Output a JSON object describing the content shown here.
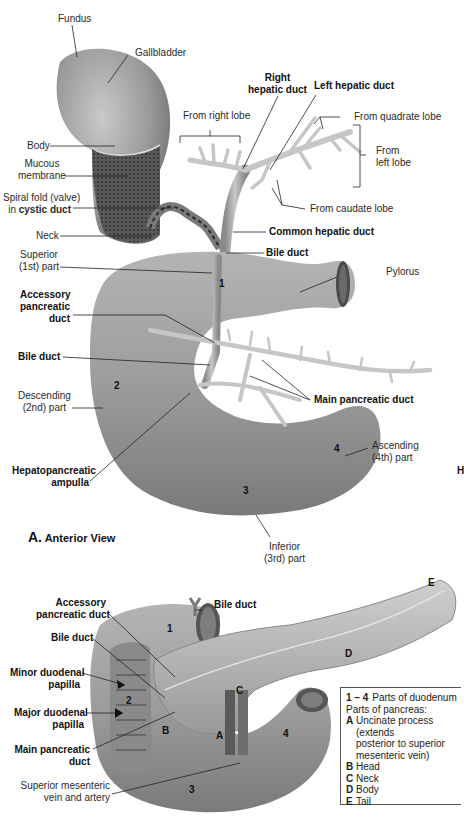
{
  "figure_a": {
    "title_letter": "A.",
    "title_text": "Anterior View",
    "labels": {
      "fundus": "Fundus",
      "gallbladder": "Gallbladder",
      "body": "Body",
      "mucous_membrane_1": "Mucous",
      "mucous_membrane_2": "membrane",
      "spiral_fold_1": "Spiral fold (valve)",
      "spiral_fold_2_prefix": "in ",
      "spiral_fold_2_bold": "cystic duct",
      "neck": "Neck",
      "from_right_lobe": "From right lobe",
      "right_hepatic_duct_1": "Right",
      "right_hepatic_duct_2": "hepatic duct",
      "left_hepatic_duct": "Left hepatic duct",
      "from_quadrate_lobe": "From quadrate lobe",
      "from_left_lobe_1": "From",
      "from_left_lobe_2": "left lobe",
      "from_caudate_lobe": "From caudate lobe",
      "common_hepatic_duct": "Common hepatic duct",
      "bile_duct_top": "Bile duct",
      "pylorus": "Pylorus",
      "superior_part_1": "Superior",
      "superior_part_2": "(1st) part",
      "accessory_pancreatic_duct_1": "Accessory",
      "accessory_pancreatic_duct_2": "pancreatic",
      "accessory_pancreatic_duct_3": "duct",
      "bile_duct_mid": "Bile duct",
      "main_pancreatic_duct": "Main pancreatic duct",
      "descending_part_1": "Descending",
      "descending_part_2": "(2nd) part",
      "hepatopancreatic_ampulla_1": "Hepatopancreatic",
      "hepatopancreatic_ampulla_2": "ampulla",
      "ascending_part_1": "Ascending",
      "ascending_part_2": "(4th) part",
      "inferior_part_1": "Inferior",
      "inferior_part_2": "(3rd) part"
    },
    "part_numbers": [
      "1",
      "2",
      "3",
      "4"
    ],
    "edge_fragment": "H"
  },
  "figure_b": {
    "labels": {
      "bile_duct": "Bile duct",
      "accessory_pancreatic_duct_1": "Accessory",
      "accessory_pancreatic_duct_2": "pancreatic duct",
      "bile_duct_left": "Bile duct",
      "minor_duodenal_papilla_1": "Minor duodenal",
      "minor_duodenal_papilla_2": "papilla",
      "major_duodenal_papilla_1": "Major duodenal",
      "major_duodenal_papilla_2": "papilla",
      "main_pancreatic_duct_1": "Main pancreatic",
      "main_pancreatic_duct_2": "duct",
      "sup_mesenteric_1": "Superior mesenteric",
      "sup_mesenteric_2": "vein and artery"
    },
    "part_numbers": [
      "1",
      "2",
      "3",
      "4"
    ],
    "pancreas_letters": [
      "A",
      "B",
      "C",
      "D",
      "E"
    ]
  },
  "legend": {
    "duodenum_key": "1 – 4",
    "duodenum_text": "Parts of duodenum",
    "pancreas_heading": "Parts of pancreas:",
    "items": [
      {
        "key": "A",
        "text": "Uncinate process (extends",
        "cont1": "posterior to superior",
        "cont2": "mesenteric vein)"
      },
      {
        "key": "B",
        "text": "Head"
      },
      {
        "key": "C",
        "text": "Neck"
      },
      {
        "key": "D",
        "text": "Body"
      },
      {
        "key": "E",
        "text": "Tail"
      }
    ]
  }
}
